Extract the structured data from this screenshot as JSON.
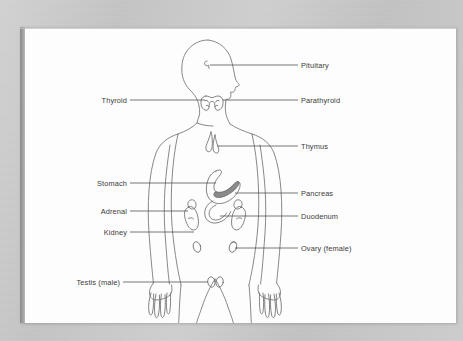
{
  "figure": {
    "orientation": "anterior view with head in right profile",
    "colors": {
      "backdrop": "#c9c9c9",
      "page": "#fdfdfd",
      "gutter_shadow": "#8d8d8d",
      "label_text": "#3a3a3a",
      "leader_line": "#4a4a4a",
      "organ_outline": "#6e6e6e",
      "body_outline": "#7a7a7a",
      "pancreas_shading": "#8a8a8a"
    }
  },
  "labels": {
    "right": [
      {
        "id": "pituitary",
        "text": "Pituitary",
        "text_x": 296,
        "text_y": 41,
        "line_x1": 278,
        "line_x2": 190,
        "line_y": 38
      },
      {
        "id": "parathyroid",
        "text": "Parathyroid",
        "text_x": 296,
        "text_y": 76,
        "line_x1": 278,
        "line_x2": 203,
        "line_y": 73
      },
      {
        "id": "thymus",
        "text": "Thymus",
        "text_x": 296,
        "text_y": 122,
        "line_x1": 278,
        "line_x2": 202,
        "line_y": 119
      },
      {
        "id": "pancreas",
        "text": "Pancreas",
        "text_x": 296,
        "text_y": 169,
        "line_x1": 278,
        "line_x2": 215,
        "line_y": 166
      },
      {
        "id": "duodenum",
        "text": "Duodenum",
        "text_x": 296,
        "text_y": 192,
        "line_x1": 278,
        "line_x2": 200,
        "line_y": 189
      },
      {
        "id": "ovary",
        "text": "Ovary (female)",
        "text_x": 296,
        "text_y": 224,
        "line_x1": 278,
        "line_x2": 190,
        "line_y": 221
      }
    ],
    "left": [
      {
        "id": "thyroid",
        "text": "Thyroid",
        "text_x": 105,
        "text_y": 76,
        "line_x1": 110,
        "line_x2": 185,
        "line_y": 73
      },
      {
        "id": "stomach",
        "text": "Stomach",
        "text_x": 105,
        "text_y": 159,
        "line_x1": 110,
        "line_x2": 188,
        "line_y": 156
      },
      {
        "id": "adrenal",
        "text": "Adrenal",
        "text_x": 105,
        "text_y": 187,
        "line_x1": 110,
        "line_x2": 166,
        "line_y": 184
      },
      {
        "id": "kidney",
        "text": "Kidney",
        "text_x": 105,
        "text_y": 208,
        "line_x1": 110,
        "line_x2": 172,
        "line_y": 205
      },
      {
        "id": "testis",
        "text": "Testis (male)",
        "text_x": 100,
        "text_y": 258,
        "line_x1": 103,
        "line_x2": 195,
        "line_y": 255
      }
    ]
  },
  "organs": [
    {
      "id": "pituitary-gland",
      "name": "Pituitary gland",
      "location": "base of brain"
    },
    {
      "id": "thyroid-gland",
      "name": "Thyroid gland",
      "location": "anterior neck"
    },
    {
      "id": "parathyroid-gland",
      "name": "Parathyroid gland",
      "location": "posterior thyroid"
    },
    {
      "id": "thymus-gland",
      "name": "Thymus",
      "location": "upper mediastinum"
    },
    {
      "id": "stomach-organ",
      "name": "Stomach",
      "location": "left upper abdomen"
    },
    {
      "id": "pancreas-organ",
      "name": "Pancreas",
      "location": "behind stomach"
    },
    {
      "id": "duodenum-organ",
      "name": "Duodenum",
      "location": "below stomach"
    },
    {
      "id": "adrenal-gland-left",
      "name": "Adrenal gland",
      "location": "superior to kidney"
    },
    {
      "id": "adrenal-gland-right",
      "name": "Adrenal gland",
      "location": "superior to kidney"
    },
    {
      "id": "kidney-left",
      "name": "Kidney",
      "location": "posterior abdomen"
    },
    {
      "id": "kidney-right",
      "name": "Kidney",
      "location": "posterior abdomen"
    },
    {
      "id": "ovary-left",
      "name": "Ovary",
      "location": "pelvis"
    },
    {
      "id": "ovary-right",
      "name": "Ovary",
      "location": "pelvis"
    },
    {
      "id": "testis-left",
      "name": "Testis",
      "location": "scrotum"
    },
    {
      "id": "testis-right",
      "name": "Testis",
      "location": "scrotum"
    }
  ]
}
